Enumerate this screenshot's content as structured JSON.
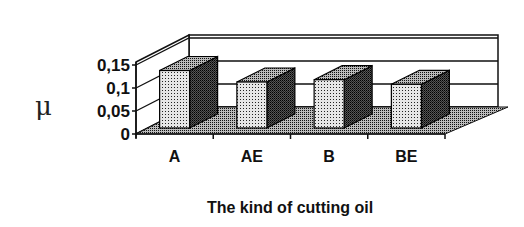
{
  "chart_data": {
    "type": "bar",
    "style": "3d-column",
    "title": "",
    "xlabel": "The kind of cutting oil",
    "ylabel": "μ",
    "categories": [
      "A",
      "AE",
      "B",
      "BE"
    ],
    "values": [
      0.125,
      0.1,
      0.105,
      0.095
    ],
    "yticks": [
      "0",
      "0,05",
      "0,1",
      "0,15"
    ],
    "ylim": [
      0,
      0.15
    ],
    "grid": true,
    "legend": null
  },
  "colors": {
    "ink": "#111111",
    "background": "#ffffff"
  }
}
